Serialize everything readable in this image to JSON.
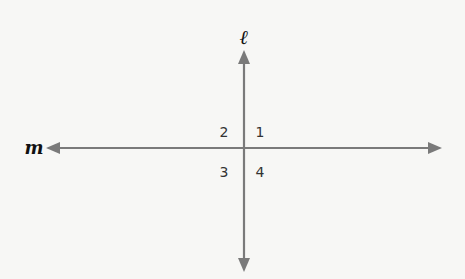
{
  "diagram": {
    "lines": [
      {
        "name": "ℓ",
        "orientation": "vertical",
        "arrows": "both ends"
      },
      {
        "name": "m",
        "orientation": "horizontal",
        "arrows": "both ends"
      }
    ],
    "angles": [
      {
        "label": "1",
        "quadrant": "upper-right"
      },
      {
        "label": "2",
        "quadrant": "upper-left"
      },
      {
        "label": "3",
        "quadrant": "lower-left"
      },
      {
        "label": "4",
        "quadrant": "lower-right"
      }
    ],
    "colors": {
      "line": "#7a7a7a",
      "label": "#111111",
      "background": "#f7f7f5"
    }
  }
}
